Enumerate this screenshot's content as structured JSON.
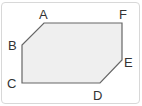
{
  "diagram": {
    "type": "hexagon",
    "vertices": [
      {
        "label": "A",
        "x": 44,
        "y": 23
      },
      {
        "label": "F",
        "x": 122,
        "y": 23
      },
      {
        "label": "E",
        "x": 122,
        "y": 60
      },
      {
        "label": "D",
        "x": 100,
        "y": 83
      },
      {
        "label": "C",
        "x": 22,
        "y": 83
      },
      {
        "label": "B",
        "x": 22,
        "y": 45
      }
    ],
    "labels": {
      "A": "A",
      "B": "B",
      "C": "C",
      "D": "D",
      "E": "E",
      "F": "F"
    },
    "colors": {
      "fill": "#efefef",
      "stroke": "#666666",
      "frame": "#d8d8d8"
    }
  }
}
